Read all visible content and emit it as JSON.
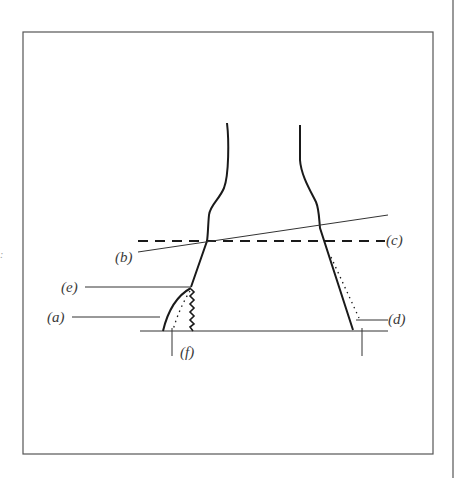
{
  "figure": {
    "colors": {
      "background": "#ffffff",
      "frame": "#555555",
      "outline": "#1a1a1a",
      "leader": "#333333",
      "label_text": "#3a3a3a"
    }
  },
  "labels": {
    "a": "(a)",
    "b": "(b)",
    "c": "(c)",
    "d": "(d)",
    "e": "(e)",
    "f": "(f)"
  },
  "stray_mark": ":"
}
